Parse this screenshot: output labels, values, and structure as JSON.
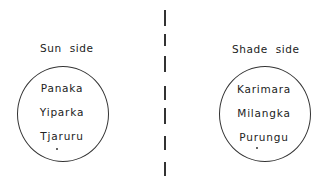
{
  "left": {
    "title": "Sun  side",
    "names": [
      "Panaka",
      "Yiparka",
      "Tjaruru"
    ]
  },
  "right": {
    "title": "Shade  side",
    "names": [
      "Karimara",
      "Milangka",
      "Purungu"
    ]
  },
  "divider": {
    "dashes": [
      [
        10,
        26
      ],
      [
        34,
        46
      ],
      [
        56,
        72
      ],
      [
        86,
        100
      ],
      [
        108,
        124
      ],
      [
        136,
        150
      ],
      [
        162,
        176
      ]
    ]
  }
}
